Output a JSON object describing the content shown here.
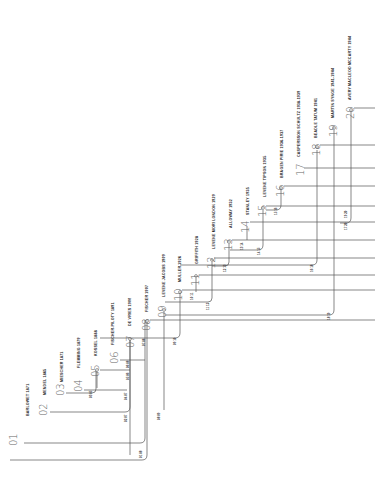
{
  "diagram": {
    "orientation": "rotated-90-ccw",
    "line_color": "#555555",
    "background": "#ffffff",
    "nodes": [
      {
        "id": "01",
        "label": "BARLOWET 1871",
        "x": 10,
        "y": 440
      },
      {
        "id": "02",
        "label": "MENDEL 1865",
        "x": 42,
        "y": 402
      },
      {
        "id": "03",
        "label": "MIESCHER 1871",
        "x": 61,
        "y": 385
      },
      {
        "id": "04",
        "label": "FLEMMING 1879",
        "x": 78,
        "y": 383
      },
      {
        "id": "05",
        "label": "KOSSEL 1888",
        "x": 95,
        "y": 367
      },
      {
        "id": "06",
        "label": "FISCHER-PILOTY 1891",
        "x": 114,
        "y": 353
      },
      {
        "id": "07",
        "label": "DE VRIES 1900",
        "x": 129,
        "y": 337
      },
      {
        "id": "08",
        "label": "FISCHER 1907",
        "x": 145,
        "y": 320
      },
      {
        "id": "09",
        "label": "LEVENE JACOBS 1909",
        "x": 162,
        "y": 308
      },
      {
        "id": "10",
        "label": "MULLER 1926",
        "x": 178,
        "y": 290
      },
      {
        "id": "11",
        "label": "GRIFFITH 1928",
        "x": 195,
        "y": 275
      },
      {
        "id": "12",
        "label": "LEVENE MORI LONDON 1929",
        "x": 211,
        "y": 258
      },
      {
        "id": "13",
        "label": "ALLOWAY 1932",
        "x": 228,
        "y": 240
      },
      {
        "id": "14",
        "label": "STANLEY 1935",
        "x": 246,
        "y": 222
      },
      {
        "id": "15",
        "label": "LEVENE TIPSON 1935",
        "x": 262,
        "y": 206
      },
      {
        "id": "16",
        "label": "BRAGEN PIRIE 1936-1937",
        "x": 279,
        "y": 186
      },
      {
        "id": "17",
        "label": "CASPERSSON SCHULTZ 1938-1939",
        "x": 300,
        "y": 165
      },
      {
        "id": "18",
        "label": "BEADLE TATUM 1941",
        "x": 316,
        "y": 145
      },
      {
        "id": "19",
        "label": "MARTIN SYNGE 1941-1944",
        "x": 333,
        "y": 126
      },
      {
        "id": "20",
        "label": "AVERY MACLEOD MCCARTY 1944",
        "x": 350,
        "y": 108
      }
    ],
    "edge_labels": [
      "01 08",
      "02 07",
      "03 05",
      "04 07",
      "05 06",
      "06 08",
      "07 08",
      "08 09",
      "09 10",
      "10 11",
      "11 12",
      "12 13",
      "13 14",
      "14 15",
      "15 16",
      "16 18",
      "17 20",
      "18 19",
      "19 20"
    ]
  }
}
